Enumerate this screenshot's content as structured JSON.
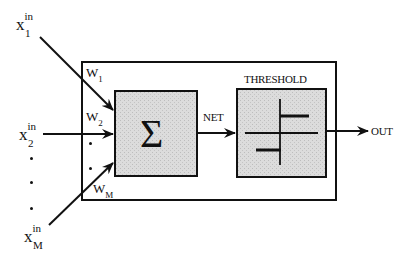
{
  "diagram": {
    "type": "artificial-neuron-block-diagram",
    "inputs": [
      {
        "name": "x",
        "superscript": "in",
        "subscript": "1",
        "weight_label": "W",
        "weight_subscript": "1"
      },
      {
        "name": "x",
        "superscript": "in",
        "subscript": "2",
        "weight_label": "W",
        "weight_subscript": "2"
      },
      {
        "name": "x",
        "superscript": "in",
        "subscript": "M",
        "weight_label": "W",
        "weight_subscript": "M"
      }
    ],
    "ellipsis": "⋮",
    "summation": {
      "symbol": "Σ"
    },
    "net_label": "NET",
    "threshold_label": "THRESHOLD",
    "output_label": "OUT",
    "colors": {
      "stroke": "#111111",
      "block_fill": "#d9d9d9",
      "background": "#ffffff"
    }
  }
}
